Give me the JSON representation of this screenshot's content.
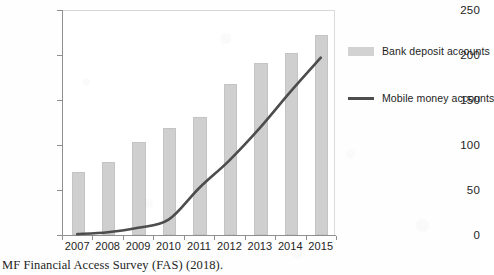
{
  "caption": "MF Financial Access Survey (FAS) (2018).",
  "legend": {
    "position": "right",
    "items": [
      {
        "label": "Bank deposit accounts",
        "marker": "bar-swatch-icon",
        "color": "#d2d2d2"
      },
      {
        "label": "Mobile money accounts",
        "marker": "line-swatch-icon",
        "color": "#4d4d4d"
      }
    ]
  },
  "chart_data": {
    "type": "bar",
    "title": "",
    "xlabel": "",
    "ylabel": "",
    "categories": [
      "2007",
      "2008",
      "2009",
      "2010",
      "2011",
      "2012",
      "2013",
      "2014",
      "2015"
    ],
    "ylim": [
      0,
      250
    ],
    "yticks": [
      0,
      50,
      100,
      150,
      200,
      250
    ],
    "grid": false,
    "series": [
      {
        "name": "Bank deposit accounts",
        "type": "bar",
        "color": "#cfcfcf",
        "values": [
          70,
          81,
          103,
          119,
          131,
          168,
          191,
          202,
          222
        ]
      },
      {
        "name": "Mobile money accounts",
        "type": "line",
        "color": "#4d4d4d",
        "values": [
          1,
          3,
          8,
          17,
          52,
          83,
          119,
          159,
          197
        ]
      }
    ]
  }
}
